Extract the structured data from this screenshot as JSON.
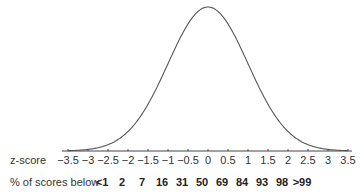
{
  "chart_data": {
    "type": "line",
    "title": "",
    "xlabel": "z-score",
    "ylabel": "",
    "xlim": [
      -3.5,
      3.5
    ],
    "grid": false,
    "legend": null,
    "x_ticks": [
      "−3.5",
      "−3",
      "−2.5",
      "−2",
      "−1.5",
      "−1",
      "−0.5",
      "0",
      "0.5",
      "1",
      "1.5",
      "2",
      "2.5",
      "3",
      "3.5"
    ],
    "x_tick_values": [
      -3.5,
      -3,
      -2.5,
      -2,
      -1.5,
      -1,
      -0.5,
      0,
      0.5,
      1,
      1.5,
      2,
      2.5,
      3,
      3.5
    ],
    "series": [
      {
        "name": "normal curve",
        "function": "standard normal pdf",
        "mean": 0,
        "sd": 1
      }
    ],
    "percentile_row": {
      "label": "% of scores below",
      "z_values": [
        -3,
        -2.5,
        -2,
        -1.5,
        -1,
        -0.5,
        0,
        0.5,
        1,
        1.5,
        2,
        2.5,
        3
      ],
      "values": [
        "<1",
        "2",
        "7",
        "16",
        "31",
        "50",
        "69",
        "84",
        "93",
        "98",
        ">99"
      ],
      "positions_z": [
        -2.5,
        -2,
        -1.5,
        -1,
        -0.5,
        0,
        0.5,
        1,
        1.5,
        2,
        2.5
      ]
    }
  },
  "labels": {
    "zscore_row": "z-score",
    "percent_row": "% of scores below"
  },
  "colors": {
    "curve": "#555555",
    "axis": "#444444",
    "text": "#333333"
  }
}
